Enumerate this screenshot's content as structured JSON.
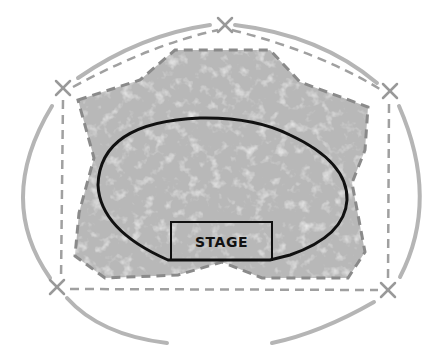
{
  "diagram": {
    "type": "venue-site-plan",
    "stage": {
      "label": "STAGE"
    },
    "colors": {
      "background": "#ffffff",
      "crowd_area_fill": "#b8b8b8",
      "crowd_area_texture": "#d8d8d8",
      "dashed_boundary": "#8a8a8a",
      "outer_arc": "#b5b5b5",
      "thin_dashed": "#a0a0a0",
      "ellipse_stroke": "#111111",
      "marker": "#999999"
    },
    "markers": [
      {
        "name": "marker-top",
        "x": 225,
        "y": 25
      },
      {
        "name": "marker-left-top",
        "x": 63,
        "y": 88
      },
      {
        "name": "marker-right-top",
        "x": 390,
        "y": 91
      },
      {
        "name": "marker-left-bottom",
        "x": 57,
        "y": 287
      },
      {
        "name": "marker-right-bottom",
        "x": 388,
        "y": 290
      }
    ]
  }
}
